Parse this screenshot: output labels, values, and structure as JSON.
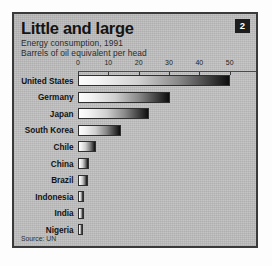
{
  "figure": {
    "badge_number": "2",
    "title": "Little and large",
    "subtitle": "Energy consumption, 1991",
    "units": "Barrels of oil equivalent per head",
    "source": "Source: UN",
    "colors": {
      "frame": "#3a3a3a",
      "background": "#bdbdbd",
      "badge_bg": "#1d1d1d",
      "badge_text": "#ffffff",
      "bar_start": "#fdfdfd",
      "bar_end": "#0d0d0d",
      "text": "#141414"
    }
  },
  "chart_data": {
    "type": "bar",
    "orientation": "horizontal",
    "title": "Little and large",
    "subtitle": "Energy consumption, 1991",
    "xlabel": "Barrels of oil equivalent per head",
    "ylabel": "",
    "xlim": [
      0,
      60
    ],
    "grid": false,
    "legend": null,
    "source": "Source: UN",
    "xticks": [
      0,
      10,
      20,
      30,
      40,
      50,
      60
    ],
    "xtick_labels": [
      "0",
      "10",
      "20",
      "30",
      "40",
      "50",
      "60"
    ],
    "categories": [
      "United States",
      "Germany",
      "Japan",
      "South Korea",
      "Chile",
      "China",
      "Brazil",
      "Indonesia",
      "India",
      "Nigeria"
    ],
    "values": [
      50.0,
      30.2,
      23.5,
      14.2,
      6.0,
      3.6,
      3.4,
      2.0,
      1.9,
      1.6
    ]
  }
}
